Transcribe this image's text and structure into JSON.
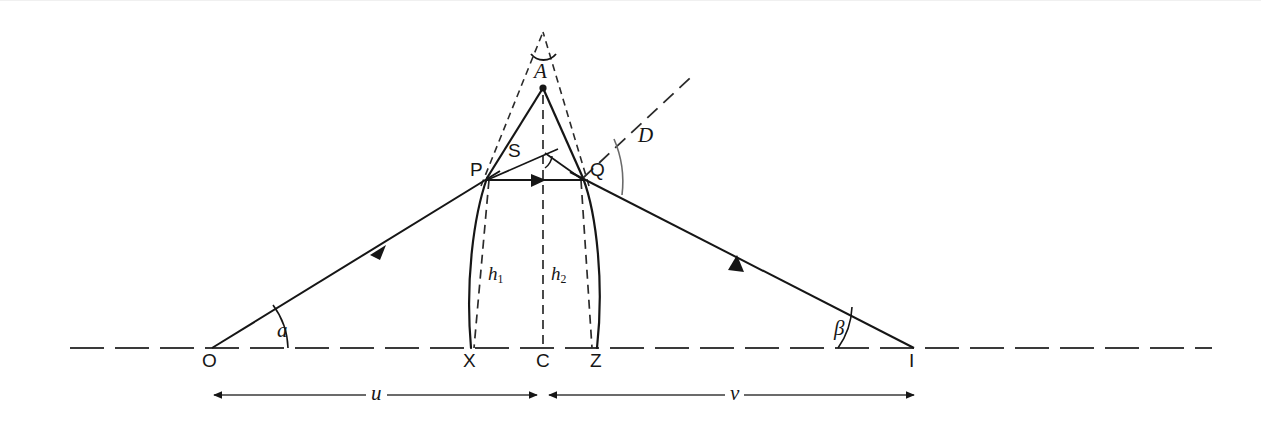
{
  "figure": {
    "background_color": "#ffffff",
    "ink_color": "#161616",
    "width": 1261,
    "height": 423
  },
  "points": {
    "O": {
      "label": "O",
      "x": 212,
      "y": 348,
      "note": "object point on axis, left"
    },
    "I": {
      "label": "I",
      "x": 914,
      "y": 348,
      "note": "image point on axis, right"
    },
    "X": {
      "label": "X",
      "x": 471,
      "y": 348,
      "note": "foot of h1 on axis"
    },
    "C": {
      "label": "C",
      "x": 543,
      "y": 348,
      "note": "centre of lens on axis"
    },
    "Z": {
      "label": "Z",
      "x": 597,
      "y": 348,
      "note": "foot of h2 on axis"
    },
    "P": {
      "label": "P",
      "x": 487,
      "y": 178,
      "note": "entry point on first surface"
    },
    "Q": {
      "label": "Q",
      "x": 583,
      "y": 178,
      "note": "exit point on second surface"
    },
    "A": {
      "label": "A",
      "x": 543,
      "y": 88,
      "note": "apex of equivalent prism"
    },
    "S": {
      "label": "S",
      "x": 545,
      "y": 158,
      "note": "vertex of deviation triangle"
    }
  },
  "angles": {
    "alpha": {
      "label": "a",
      "at": "O",
      "note": "angle of incident ray with axis"
    },
    "beta": {
      "label": "β",
      "at": "I",
      "note": "angle of emergent ray with axis"
    },
    "D": {
      "label": "D",
      "at": "Q",
      "note": "total deviation angle"
    },
    "A": {
      "label": "A",
      "at": "apex",
      "note": "prism apex angle"
    },
    "S": {
      "label": "S",
      "at": "S",
      "note": "small angle at S"
    }
  },
  "heights": {
    "h1": {
      "label": "h",
      "sub": "1",
      "from": "P",
      "to": "X"
    },
    "h2": {
      "label": "h",
      "sub": "2",
      "from": "Q",
      "to": "Z"
    }
  },
  "distances": {
    "u": {
      "label": "u",
      "from": "O",
      "to": "C",
      "note": "object distance"
    },
    "v": {
      "label": "v",
      "from": "C",
      "to": "I",
      "note": "image distance"
    }
  },
  "elements": {
    "optical_axis": "horizontal dash-dot axis line through O, X, C, Z, I",
    "lens_body": "biconvex lens outline from X to Z with curved left and right surfaces",
    "incident_ray": "solid ray from O to P with arrowhead",
    "internal_ray": "horizontal solid ray from P to Q with arrowhead",
    "emergent_ray": "solid ray from Q to I with arrowhead",
    "prism_dashed": "dashed lines from P and Q extending up to apex above A",
    "axis_dashed": "vertical dashed centre line through C, S and A",
    "deviation_dashed": "dashed extension of incident ray beyond Q"
  }
}
